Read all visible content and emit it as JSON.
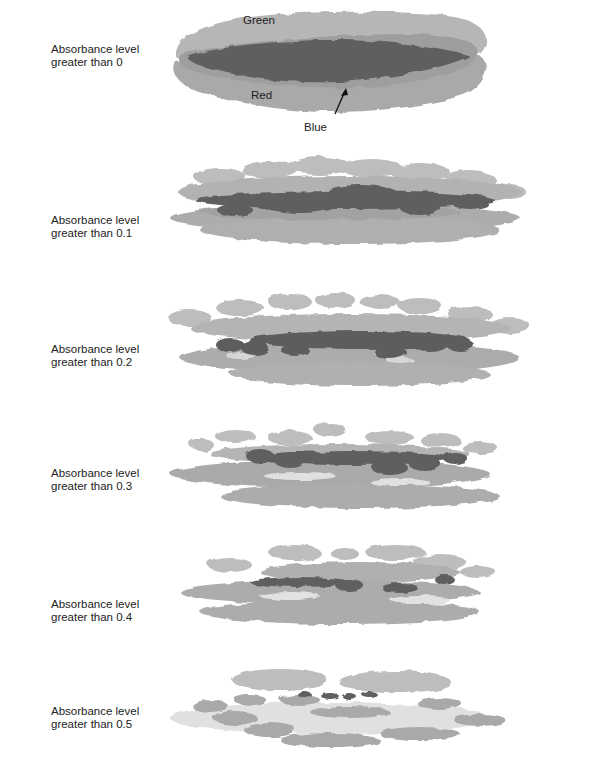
{
  "figure": {
    "colors": {
      "green": "#b5b5b5",
      "red": "#a9a9a9",
      "blue": "#5e5e5e",
      "pale": "#dcdcdc",
      "background": "#ffffff"
    },
    "annotations": {
      "green": "Green",
      "red": "Red",
      "blue": "Blue"
    },
    "panels": [
      {
        "line1": "Absorbance level",
        "line2": "greater than 0",
        "threshold": 0
      },
      {
        "line1": "Absorbance level",
        "line2": "greater than 0.1",
        "threshold": 0.1
      },
      {
        "line1": "Absorbance level",
        "line2": "greater than 0.2",
        "threshold": 0.2
      },
      {
        "line1": "Absorbance level",
        "line2": "greater than 0.3",
        "threshold": 0.3
      },
      {
        "line1": "Absorbance level",
        "line2": "greater than 0.4",
        "threshold": 0.4
      },
      {
        "line1": "Absorbance level",
        "line2": "greater than 0.5",
        "threshold": 0.5
      }
    ]
  }
}
